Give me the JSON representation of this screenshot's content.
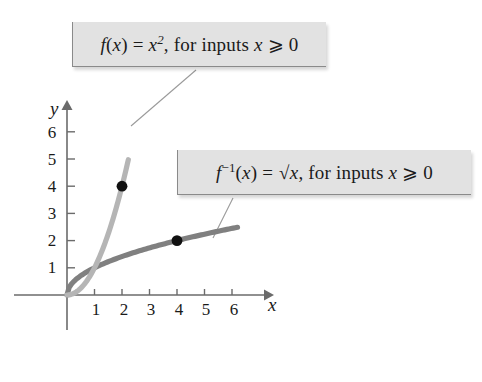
{
  "figure": {
    "background_color": "#ffffff",
    "axes": {
      "x_axis_label": "x",
      "y_axis_label": "y",
      "x_ticks": [
        "1",
        "2",
        "3",
        "4",
        "5",
        "6"
      ],
      "y_ticks": [
        "1",
        "2",
        "3",
        "4",
        "5",
        "6"
      ],
      "axis_color": "#6b6b6b",
      "origin_px": [
        67,
        295
      ],
      "unit_px_x": 27.5,
      "unit_px_y": 27.2
    },
    "callouts": [
      {
        "name": "square-function",
        "text": "f(x) = x², for inputs x ⩾ 0",
        "fill": "#e2e2e2",
        "border": "#8a8a8a"
      },
      {
        "name": "sqrt-function",
        "text": "f⁻¹(x) = √x, for inputs x ⩾ 0",
        "fill": "#e2e2e2",
        "border": "#8a8a8a"
      }
    ],
    "points": [
      {
        "label": "(2, 4)",
        "x": 2,
        "y": 4,
        "color": "#111111"
      },
      {
        "label": "(4, 2)",
        "x": 4,
        "y": 2,
        "color": "#111111"
      }
    ]
  },
  "chart_data": {
    "type": "line",
    "title": "",
    "xlabel": "x",
    "ylabel": "y",
    "xlim": [
      0,
      7
    ],
    "ylim": [
      0,
      6.6
    ],
    "grid": false,
    "legend_position": "callout-boxes",
    "x_ticks": [
      1,
      2,
      3,
      4,
      5,
      6
    ],
    "y_ticks": [
      1,
      2,
      3,
      4,
      5,
      6
    ],
    "series": [
      {
        "name": "f(x) = x², for inputs x ⩾ 0",
        "color": "#b5b5b5",
        "domain": [
          0,
          2.23
        ],
        "x": [
          0,
          0.25,
          0.5,
          0.75,
          1,
          1.25,
          1.5,
          1.75,
          2,
          2.23
        ],
        "values": [
          0,
          0.0625,
          0.25,
          0.5625,
          1,
          1.5625,
          2.25,
          3.0625,
          4,
          4.97
        ],
        "marked_point": [
          2,
          4
        ]
      },
      {
        "name": "f⁻¹(x) = √x, for inputs x ⩾ 0",
        "color": "#808080",
        "domain": [
          0,
          6.2
        ],
        "x": [
          0,
          0.25,
          0.5,
          1,
          1.5,
          2,
          2.5,
          3,
          3.5,
          4,
          4.5,
          5,
          5.5,
          6,
          6.2
        ],
        "values": [
          0,
          0.5,
          0.707,
          1,
          1.225,
          1.414,
          1.581,
          1.732,
          1.871,
          2,
          2.121,
          2.236,
          2.345,
          2.449,
          2.49
        ],
        "marked_point": [
          4,
          2
        ]
      }
    ],
    "annotations": [
      {
        "text": "f(x) = x², for inputs x ⩾ 0",
        "points_to_series": "f(x) = x², for inputs x ⩾ 0"
      },
      {
        "text": "f⁻¹(x) = √x, for inputs x ⩾ 0",
        "points_to_series": "f⁻¹(x) = √x, for inputs x ⩾ 0"
      }
    ]
  },
  "tick_positions": {
    "x": [
      {
        "label": "1",
        "left": 86,
        "top": 300
      },
      {
        "label": "2",
        "left": 114,
        "top": 300
      },
      {
        "label": "3",
        "left": 141,
        "top": 300
      },
      {
        "label": "4",
        "left": 169,
        "top": 300
      },
      {
        "label": "5",
        "left": 196,
        "top": 300
      },
      {
        "label": "6",
        "left": 224,
        "top": 300
      }
    ],
    "y": [
      {
        "label": "1",
        "left": 42,
        "top": 258
      },
      {
        "label": "2",
        "left": 42,
        "top": 231
      },
      {
        "label": "3",
        "left": 42,
        "top": 204
      },
      {
        "label": "4",
        "left": 42,
        "top": 177
      },
      {
        "label": "5",
        "left": 42,
        "top": 150
      },
      {
        "label": "6",
        "left": 42,
        "top": 123
      }
    ]
  }
}
